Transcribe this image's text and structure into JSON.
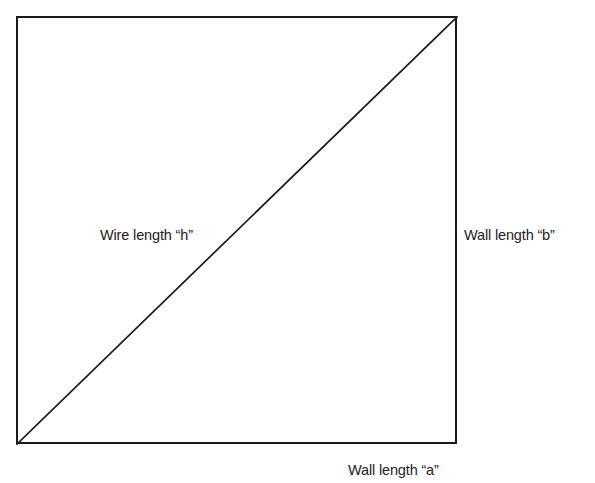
{
  "diagram": {
    "kind": "right-triangle-geometry-diagram",
    "background_color": "#ffffff",
    "stroke_color": "#1a1a1a",
    "text_color": "#242021",
    "labels": {
      "wire_hypotenuse": "Wire length “h”",
      "wall_vertical": "Wall length “b”",
      "wall_horizontal": "Wall length “a”"
    },
    "geometry": {
      "rectangle": {
        "left": 16,
        "top": 16,
        "width": 441,
        "height": 428,
        "border_width_px": 2.3
      },
      "diagonal": {
        "from": [
          0,
          428
        ],
        "to": [
          441,
          0
        ],
        "stroke_width_px": 1.6,
        "orientation": "bottom-left-to-top-right"
      },
      "label_positions": {
        "wire_hypotenuse": [
          100,
          228
        ],
        "wall_vertical": [
          464,
          228
        ],
        "wall_horizontal": [
          348,
          463
        ]
      }
    }
  }
}
